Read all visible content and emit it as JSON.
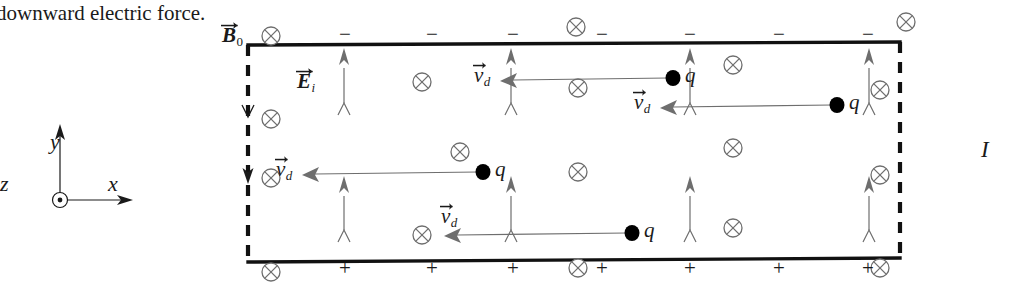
{
  "figure": {
    "caption_text": "downward electric force.",
    "current_label": "I",
    "axes": {
      "x_label": "x",
      "y_label": "y",
      "z_label": "z",
      "z_symbol": "out-of-page-dot"
    },
    "field_label": "B",
    "field_label_sub": "0",
    "induced_field_label": "E",
    "induced_field_label_sub": "i",
    "drift_label": "v",
    "drift_label_sub": "d",
    "charge_label": "q",
    "top_surface_sign": "−",
    "bottom_surface_sign": "+",
    "top_sign_count": 7,
    "bottom_sign_count": 6,
    "b_field_symbol": "into-page-cross",
    "colors": {
      "ink": "#1a1a1a",
      "slab_edge": "#111111",
      "thin_line": "#6e6e6e",
      "background": "#ffffff"
    }
  },
  "slab": {
    "left": 248,
    "right": 900,
    "top": 45,
    "bottom": 262,
    "solid_edges": [
      "top",
      "bottom"
    ],
    "dashed_edges": [
      "left",
      "right"
    ]
  },
  "b_field_markers": [
    {
      "x": 271,
      "y": 36
    },
    {
      "x": 576,
      "y": 27
    },
    {
      "x": 906,
      "y": 22
    },
    {
      "x": 422,
      "y": 82
    },
    {
      "x": 578,
      "y": 88
    },
    {
      "x": 733,
      "y": 65
    },
    {
      "x": 880,
      "y": 90
    },
    {
      "x": 271,
      "y": 119
    },
    {
      "x": 460,
      "y": 152
    },
    {
      "x": 733,
      "y": 148
    },
    {
      "x": 578,
      "y": 172
    },
    {
      "x": 271,
      "y": 178
    },
    {
      "x": 880,
      "y": 175
    },
    {
      "x": 422,
      "y": 235
    },
    {
      "x": 733,
      "y": 228
    },
    {
      "x": 271,
      "y": 272
    },
    {
      "x": 578,
      "y": 268
    },
    {
      "x": 880,
      "y": 268
    }
  ],
  "e_field_arrows": [
    {
      "x": 344,
      "top": 48,
      "bottom": 125
    },
    {
      "x": 511,
      "top": 48,
      "bottom": 125
    },
    {
      "x": 690,
      "top": 48,
      "bottom": 125
    },
    {
      "x": 869,
      "top": 48,
      "bottom": 125
    },
    {
      "x": 344,
      "top": 176,
      "bottom": 252
    },
    {
      "x": 511,
      "top": 176,
      "bottom": 252
    },
    {
      "x": 690,
      "top": 176,
      "bottom": 252
    },
    {
      "x": 869,
      "top": 176,
      "bottom": 252
    }
  ],
  "drift_arrows": [
    {
      "label_x": 474,
      "label_y": 78,
      "tip_x": 513,
      "tail_x": 668,
      "y": 80,
      "dot_x": 673,
      "q_x": 685,
      "q_y": 78
    },
    {
      "label_x": 634,
      "label_y": 105,
      "tip_x": 673,
      "tail_x": 832,
      "y": 107,
      "dot_x": 837,
      "q_x": 849,
      "q_y": 105
    },
    {
      "label_x": 276,
      "label_y": 172,
      "tip_x": 315,
      "tail_x": 478,
      "y": 174,
      "dot_x": 483,
      "q_x": 495,
      "q_y": 172
    },
    {
      "label_x": 441,
      "label_y": 219,
      "tip_x": 457,
      "tail_x": 627,
      "y": 235,
      "dot_x": 632,
      "q_x": 644,
      "q_y": 233
    }
  ],
  "top_signs_x": [
    345,
    432,
    513,
    602,
    690,
    779,
    868
  ],
  "bottom_signs_x": [
    345,
    432,
    513,
    602,
    690,
    779
  ],
  "left_arrow": {
    "x": 248,
    "from_y": 105,
    "to_y": 178
  }
}
